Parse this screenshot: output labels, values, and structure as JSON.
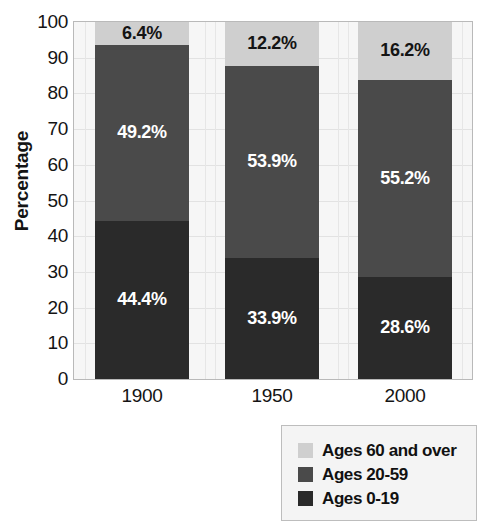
{
  "chart_data": {
    "type": "bar",
    "subtype": "stacked-bar-100",
    "title": "",
    "xlabel": "",
    "ylabel": "Percentage",
    "ylim": [
      0,
      100
    ],
    "ytick_labels": [
      "100",
      "90",
      "80",
      "70",
      "60",
      "50",
      "40",
      "30",
      "20",
      "10",
      "0"
    ],
    "ytick_values": [
      100,
      90,
      80,
      70,
      60,
      50,
      40,
      30,
      20,
      10,
      0
    ],
    "grid": true,
    "legend_position": "bottom-right",
    "categories": [
      "1900",
      "1950",
      "2000"
    ],
    "series": [
      {
        "name": "Ages 60 and over",
        "color": "#cfcfcf",
        "values": [
          6.4,
          12.2,
          16.2
        ],
        "labels": [
          "6.4%",
          "12.2%",
          "16.2%"
        ],
        "label_color": "#141414"
      },
      {
        "name": "Ages 20-59",
        "color": "#4a4a4a",
        "values": [
          49.2,
          53.9,
          55.2
        ],
        "labels": [
          "49.2%",
          "53.9%",
          "55.2%"
        ],
        "label_color": "#ffffff"
      },
      {
        "name": "Ages 0-19",
        "color": "#2a2a2a",
        "values": [
          44.4,
          33.9,
          28.6
        ],
        "labels": [
          "44.4%",
          "33.9%",
          "28.6%"
        ],
        "label_color": "#ffffff"
      }
    ]
  },
  "legend": {
    "entries": [
      {
        "label": "Ages 60 and over",
        "color": "#cfcfcf"
      },
      {
        "label": "Ages 20-59",
        "color": "#4a4a4a"
      },
      {
        "label": "Ages 0-19",
        "color": "#2a2a2a"
      }
    ]
  },
  "axes": {
    "y_title": "Percentage"
  }
}
